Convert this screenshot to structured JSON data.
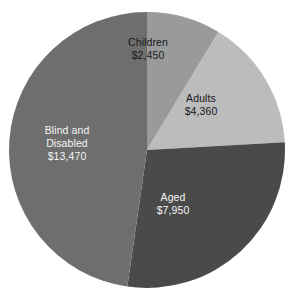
{
  "chart_data": {
    "type": "pie",
    "title": "",
    "subtitle": "",
    "xlabel": "",
    "ylabel": "",
    "grid": false,
    "legend": "none",
    "value_prefix": "$",
    "total": 28230,
    "categories": [
      "Children",
      "Adults",
      "Aged",
      "Blind and Disabled"
    ],
    "values": [
      2450,
      4360,
      7950,
      13470
    ],
    "start_angle_deg": 0,
    "direction": "clockwise",
    "slices": [
      {
        "label": "Children",
        "label_line1": "Children",
        "label_line2": "",
        "value": 2450,
        "value_text": "$2,450",
        "percent": 8.7,
        "start_deg": 0.0,
        "end_deg": 31.2,
        "color": "#9a9a9a",
        "text_color": "#16181a"
      },
      {
        "label": "Adults",
        "label_line1": "Adults",
        "label_line2": "",
        "value": 4360,
        "value_text": "$4,360",
        "percent": 15.4,
        "start_deg": 31.2,
        "end_deg": 86.8,
        "color": "#bcbcbc",
        "text_color": "#16181a"
      },
      {
        "label": "Aged",
        "label_line1": "Aged",
        "label_line2": "",
        "value": 7950,
        "value_text": "$7,950",
        "percent": 28.2,
        "start_deg": 86.8,
        "end_deg": 188.2,
        "color": "#4a4a4a",
        "text_color": "#f4f5f6"
      },
      {
        "label": "Blind and Disabled",
        "label_line1": "Blind and",
        "label_line2": "Disabled",
        "value": 13470,
        "value_text": "$13,470",
        "percent": 47.7,
        "start_deg": 188.2,
        "end_deg": 360.0,
        "color": "#6e6e6e",
        "text_color": "#f4f5f6"
      }
    ],
    "background_color": "#ffffff",
    "geometry": {
      "center_x": 147,
      "center_y": 150,
      "radius": 138
    }
  }
}
